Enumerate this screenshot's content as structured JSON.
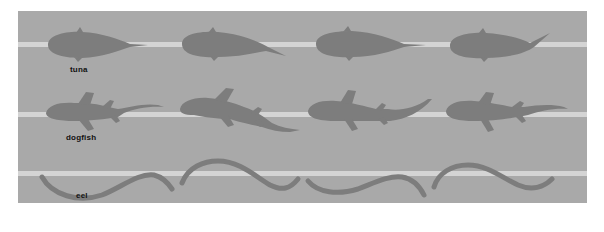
{
  "figure": {
    "background_color": "#a9a9a9",
    "line_color": "#d6d6d6",
    "silhouette_color": "#7e7e7e",
    "rows": [
      {
        "label": "tuna",
        "frames": 4,
        "icon": "tuna-silhouette"
      },
      {
        "label": "dogfish",
        "frames": 4,
        "icon": "dogfish-silhouette"
      },
      {
        "label": "eel",
        "frames": 4,
        "icon": "eel-silhouette"
      }
    ]
  }
}
